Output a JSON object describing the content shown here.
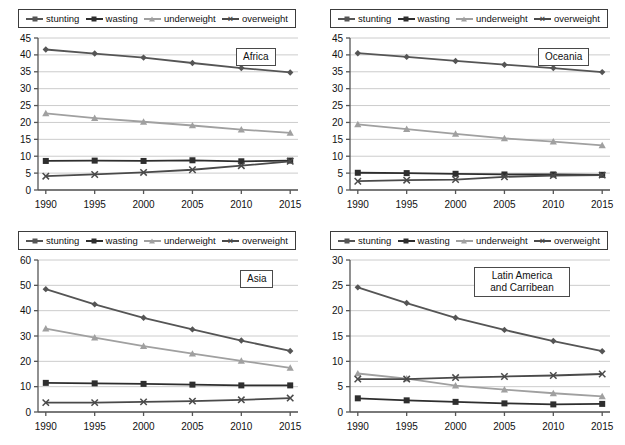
{
  "legend": {
    "items": [
      {
        "label": "stunting",
        "marker": "diamond",
        "color": "#555555",
        "icon": "line-diamond-icon"
      },
      {
        "label": "wasting",
        "marker": "square",
        "color": "#2e2e2e",
        "icon": "line-square-icon"
      },
      {
        "label": "underweight",
        "marker": "triangle",
        "color": "#a0a0a0",
        "icon": "line-triangle-icon"
      },
      {
        "label": "overweight",
        "marker": "x",
        "color": "#4a4a4a",
        "icon": "line-x-icon"
      }
    ]
  },
  "colors": {
    "stunting": "#555555",
    "wasting": "#2e2e2e",
    "underweight": "#a0a0a0",
    "overweight": "#4a4a4a",
    "grid": "#cccccc",
    "axis": "#555555",
    "frame": "#3c3c3c"
  },
  "panels": [
    {
      "id": "africa",
      "title": "Africa"
    },
    {
      "id": "oceania",
      "title": "Oceania"
    },
    {
      "id": "asia",
      "title": "Asia"
    },
    {
      "id": "latin",
      "title": "Latin America and Carribean"
    }
  ],
  "chart_data": [
    {
      "type": "line",
      "title": "Africa",
      "xlabel": "",
      "ylabel": "",
      "x": [
        1990,
        1995,
        2000,
        2005,
        2010,
        2015
      ],
      "categories": [
        "1990",
        "1995",
        "2000",
        "2005",
        "2010",
        "2015"
      ],
      "ylim": [
        0,
        45
      ],
      "yticks": [
        0,
        5,
        10,
        15,
        20,
        25,
        30,
        35,
        40,
        45
      ],
      "grid": true,
      "legend_position": "top",
      "series": [
        {
          "name": "stunting",
          "values": [
            41.6,
            40.4,
            39.2,
            37.6,
            36.1,
            34.8
          ]
        },
        {
          "name": "wasting",
          "values": [
            8.6,
            8.7,
            8.6,
            8.8,
            8.5,
            8.7
          ]
        },
        {
          "name": "underweight",
          "values": [
            22.7,
            21.3,
            20.2,
            19.1,
            17.9,
            16.9
          ]
        },
        {
          "name": "overweight",
          "values": [
            4.1,
            4.6,
            5.2,
            6.0,
            7.2,
            8.5
          ]
        }
      ]
    },
    {
      "type": "line",
      "title": "Oceania",
      "xlabel": "",
      "ylabel": "",
      "x": [
        1990,
        1995,
        2000,
        2005,
        2010,
        2015
      ],
      "categories": [
        "1990",
        "1995",
        "2000",
        "2005",
        "2010",
        "2015"
      ],
      "ylim": [
        0,
        45
      ],
      "yticks": [
        0,
        5,
        10,
        15,
        20,
        25,
        30,
        35,
        40,
        45
      ],
      "grid": true,
      "legend_position": "top",
      "series": [
        {
          "name": "stunting",
          "values": [
            40.5,
            39.4,
            38.2,
            37.1,
            36.1,
            34.9
          ]
        },
        {
          "name": "wasting",
          "values": [
            5.1,
            5.0,
            4.8,
            4.6,
            4.6,
            4.5
          ]
        },
        {
          "name": "underweight",
          "values": [
            19.4,
            18.0,
            16.6,
            15.3,
            14.3,
            13.2
          ]
        },
        {
          "name": "overweight",
          "values": [
            2.6,
            2.9,
            3.1,
            3.9,
            4.3,
            4.4
          ]
        }
      ]
    },
    {
      "type": "line",
      "title": "Asia",
      "xlabel": "",
      "ylabel": "",
      "x": [
        1990,
        1995,
        2000,
        2005,
        2010,
        2015
      ],
      "categories": [
        "1990",
        "1995",
        "2000",
        "2005",
        "2010",
        "2015"
      ],
      "ylim": [
        0,
        60
      ],
      "yticks": [
        0,
        10,
        20,
        30,
        40,
        50,
        60
      ],
      "grid": true,
      "legend_position": "top",
      "series": [
        {
          "name": "stunting",
          "values": [
            48.5,
            42.5,
            37.2,
            32.6,
            28.2,
            24.1
          ]
        },
        {
          "name": "wasting",
          "values": [
            11.5,
            11.3,
            11.1,
            10.8,
            10.5,
            10.5
          ]
        },
        {
          "name": "underweight",
          "values": [
            32.9,
            29.4,
            26.0,
            23.0,
            20.2,
            17.4
          ]
        },
        {
          "name": "overweight",
          "values": [
            3.7,
            3.7,
            4.0,
            4.3,
            4.8,
            5.5
          ]
        }
      ]
    },
    {
      "type": "line",
      "title": "Latin America and Carribean",
      "xlabel": "",
      "ylabel": "",
      "x": [
        1990,
        1995,
        2000,
        2005,
        2010,
        2015
      ],
      "categories": [
        "1990",
        "1995",
        "2000",
        "2005",
        "2010",
        "2015"
      ],
      "ylim": [
        0,
        30
      ],
      "yticks": [
        0,
        5,
        10,
        15,
        20,
        25,
        30
      ],
      "grid": true,
      "legend_position": "top",
      "series": [
        {
          "name": "stunting",
          "values": [
            24.6,
            21.5,
            18.6,
            16.2,
            14.0,
            12.0
          ]
        },
        {
          "name": "wasting",
          "values": [
            2.7,
            2.3,
            2.0,
            1.7,
            1.5,
            1.6
          ]
        },
        {
          "name": "underweight",
          "values": [
            7.6,
            6.6,
            5.2,
            4.4,
            3.7,
            3.1
          ]
        },
        {
          "name": "overweight",
          "values": [
            6.5,
            6.5,
            6.8,
            7.0,
            7.2,
            7.5
          ]
        }
      ]
    }
  ]
}
